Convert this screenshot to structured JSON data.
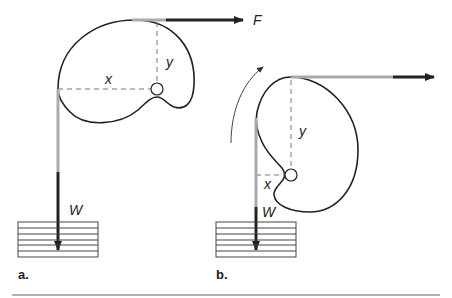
{
  "figure": {
    "panels": [
      {
        "id": "a",
        "label": "a.",
        "force_label": "F",
        "weight_label": "W",
        "x_label": "x",
        "y_label": "y"
      },
      {
        "id": "b",
        "label": "b.",
        "weight_label": "W",
        "x_label": "x",
        "y_label": "y",
        "rotation_indicator": "curved-arrow"
      }
    ],
    "colors": {
      "stroke": "#222222",
      "rope": "#999999",
      "dashed": "#777777"
    }
  }
}
